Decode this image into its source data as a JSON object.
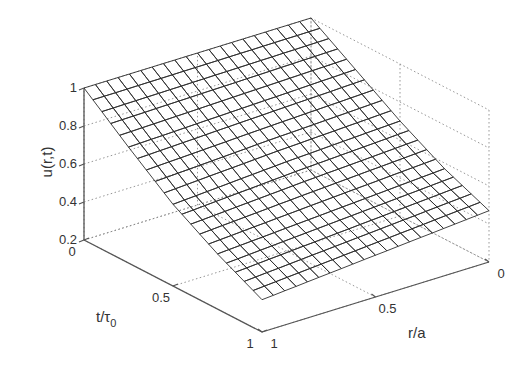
{
  "chart_data": {
    "type": "surface3d",
    "title": "",
    "xlabel": "t/τ0",
    "xlabel_main": "t/τ",
    "xlabel_sub": "0",
    "ylabel": "r/a",
    "zlabel": "u(r,t)",
    "x_range": [
      0,
      1
    ],
    "y_range": [
      0,
      1
    ],
    "zlim": [
      0.2,
      1
    ],
    "x_ticks": [
      0,
      0.5,
      1
    ],
    "x_tick_labels": [
      "0",
      "0.5",
      "1"
    ],
    "y_ticks": [
      0,
      0.5,
      1
    ],
    "y_tick_labels": [
      "0",
      "0.5",
      "1"
    ],
    "z_ticks": [
      0.2,
      0.4,
      0.6,
      0.8,
      1
    ],
    "z_tick_labels": [
      "0.2",
      "0.4",
      "0.6",
      "0.8",
      "1"
    ],
    "grid": true,
    "mesh_resolution": 20,
    "surface_color": "#8c8c8c",
    "mesh_color": "#2e2e2e",
    "corner_values": {
      "t0_r0": 1.0,
      "t0_r1": 1.0,
      "t0.5_r1": 0.63,
      "t1_r1": 0.37,
      "t1_r0": 0.47
    },
    "x": [
      0,
      0.25,
      0.5,
      0.75,
      1
    ],
    "y_r": [
      0,
      0.5,
      1
    ],
    "series": [
      {
        "name": "r/a = 0",
        "values": [
          1.0,
          0.85,
          0.7,
          0.57,
          0.47
        ]
      },
      {
        "name": "r/a = 0.5",
        "values": [
          1.0,
          0.83,
          0.67,
          0.53,
          0.42
        ]
      },
      {
        "name": "r/a = 1",
        "values": [
          1.0,
          0.81,
          0.63,
          0.49,
          0.37
        ]
      }
    ]
  }
}
